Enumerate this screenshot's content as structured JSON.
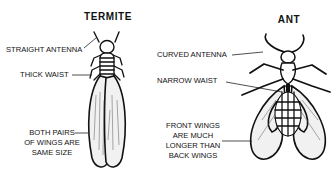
{
  "termite": {
    "title": "TERMITE",
    "labels": {
      "antenna": "STRAIGHT ANTENNA",
      "waist": "THICK WAIST",
      "wings": [
        "BOTH PAIRS",
        "OF WINGS ARE",
        "SAME SIZE"
      ]
    }
  },
  "ant": {
    "title": "ANT",
    "labels": {
      "antenna": "CURVED ANTENNA",
      "waist": "NARROW WAIST",
      "wings": [
        "FRONT WINGS",
        "ARE MUCH",
        "LONGER THAN",
        "BACK WINGS"
      ]
    }
  }
}
